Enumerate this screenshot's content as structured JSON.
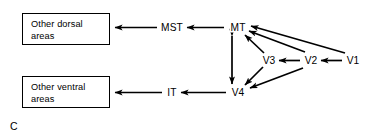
{
  "figure": {
    "panel_letter": "C",
    "background_color": "#ffffff",
    "stroke_color": "#000000"
  },
  "boxes": [
    {
      "id": "other-dorsal-areas",
      "line1": "Other dorsal",
      "line2": "areas"
    },
    {
      "id": "other-ventral-areas",
      "line1": "Other ventral",
      "line2": "areas"
    }
  ],
  "nodes": [
    {
      "id": "mst",
      "label": "MST",
      "x": 172,
      "y": 27
    },
    {
      "id": "mt",
      "label": "MT",
      "x": 238,
      "y": 27
    },
    {
      "id": "v3",
      "label": "V3",
      "x": 269,
      "y": 60
    },
    {
      "id": "v2",
      "label": "V2",
      "x": 311,
      "y": 60
    },
    {
      "id": "v1",
      "label": "V1",
      "x": 353,
      "y": 60
    },
    {
      "id": "it",
      "label": "IT",
      "x": 172,
      "y": 92
    },
    {
      "id": "v4",
      "label": "V4",
      "x": 238,
      "y": 92
    }
  ],
  "edges": [
    {
      "id": "mst-to-other-dorsal",
      "from": "MST",
      "to": "Other dorsal areas",
      "direction": "unidirectional"
    },
    {
      "id": "mt-to-mst",
      "from": "MT",
      "to": "MST",
      "direction": "unidirectional"
    },
    {
      "id": "it-to-other-ventral",
      "from": "IT",
      "to": "Other ventral areas",
      "direction": "unidirectional"
    },
    {
      "id": "v4-to-it",
      "from": "V4",
      "to": "IT",
      "direction": "unidirectional"
    },
    {
      "id": "mt-v4",
      "from": "MT",
      "to": "V4",
      "direction": "bidirectional"
    },
    {
      "id": "v3-to-mt",
      "from": "V3",
      "to": "MT",
      "direction": "unidirectional"
    },
    {
      "id": "v3-to-v4",
      "from": "V3",
      "to": "V4",
      "direction": "unidirectional"
    },
    {
      "id": "v2-to-v3",
      "from": "V2",
      "to": "V3",
      "direction": "unidirectional"
    },
    {
      "id": "v2-to-mt",
      "from": "V2",
      "to": "MT",
      "direction": "unidirectional"
    },
    {
      "id": "v2-to-v4",
      "from": "V2",
      "to": "V4",
      "direction": "unidirectional"
    },
    {
      "id": "v1-to-v2",
      "from": "V1",
      "to": "V2",
      "direction": "unidirectional"
    },
    {
      "id": "v1-to-mt",
      "from": "V1",
      "to": "MT",
      "direction": "unidirectional"
    }
  ]
}
